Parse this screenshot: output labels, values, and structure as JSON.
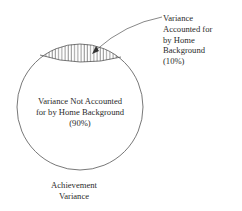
{
  "diagram": {
    "type": "venn-circle-with-shaded-segment",
    "colors": {
      "stroke": "#555555",
      "text": "#2a2a2a",
      "background": "#ffffff"
    },
    "callout_label": {
      "lines": [
        "Variance",
        "Accounted for",
        "by Home",
        "Background",
        "(10%)"
      ]
    },
    "inner_label": {
      "lines": [
        "Variance Not Accounted",
        "for by Home Background",
        "(90%)"
      ]
    },
    "caption": {
      "lines": [
        "Achievement",
        "Variance"
      ]
    },
    "segments": [
      {
        "name": "Variance Accounted for by Home Background",
        "percent": 10,
        "fill": "vertical-hatch"
      },
      {
        "name": "Variance Not Accounted for by Home Background",
        "percent": 90,
        "fill": "none"
      }
    ]
  }
}
